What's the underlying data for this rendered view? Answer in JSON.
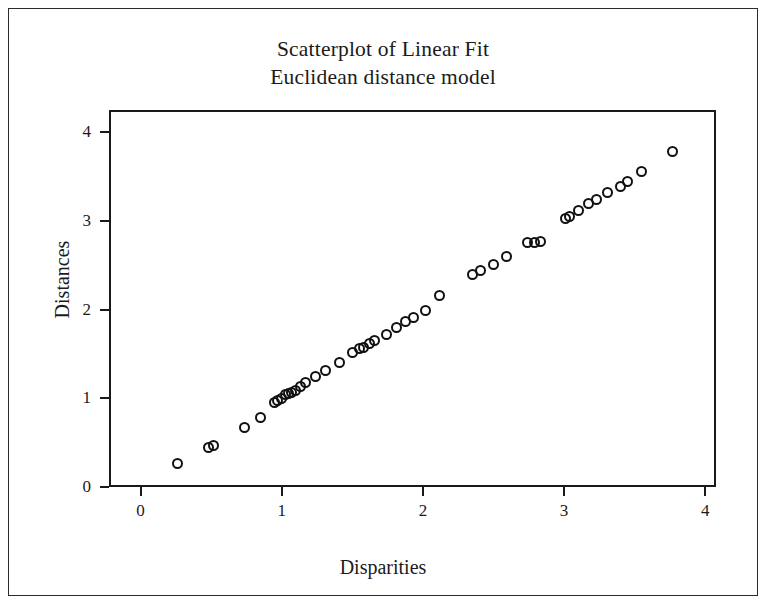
{
  "figure": {
    "title_line1": "Scatterplot of Linear Fit",
    "title_line2": "Euclidean distance model"
  },
  "chart_data": {
    "type": "scatter",
    "title": "Scatterplot of Linear Fit\nEuclidean distance model",
    "subtitle": "Euclidean distance model",
    "xlabel": "Disparities",
    "ylabel": "Distances",
    "xlim": [
      -0.22,
      4.32
    ],
    "ylim": [
      -0.33,
      4.25
    ],
    "xticks": [
      0,
      1,
      2,
      3,
      4
    ],
    "yticks": [
      0,
      1,
      2,
      3,
      4
    ],
    "xtick_labels": [
      "0",
      "1",
      "2",
      "3",
      "4"
    ],
    "ytick_labels": [
      "0",
      "1",
      "2",
      "3",
      "4"
    ],
    "grid": false,
    "legend": false,
    "marker": "open-circle",
    "marker_color": "#111111",
    "n_points": 45,
    "series": [
      {
        "name": "Euclidean distance model",
        "x": [
          0.26,
          0.48,
          0.52,
          0.74,
          0.85,
          0.95,
          0.97,
          1.0,
          1.03,
          1.05,
          1.07,
          1.1,
          1.13,
          1.17,
          1.24,
          1.31,
          1.41,
          1.5,
          1.55,
          1.58,
          1.62,
          1.66,
          1.74,
          1.81,
          1.88,
          1.93,
          2.02,
          2.12,
          2.35,
          2.41,
          2.5,
          2.59,
          2.74,
          2.79,
          2.83,
          3.01,
          3.04,
          3.1,
          3.17,
          3.23,
          3.31,
          3.4,
          3.45,
          3.55,
          3.77
        ],
        "y": [
          0.27,
          0.45,
          0.47,
          0.67,
          0.78,
          0.95,
          0.97,
          1.0,
          1.04,
          1.05,
          1.06,
          1.09,
          1.13,
          1.18,
          1.24,
          1.31,
          1.4,
          1.52,
          1.56,
          1.57,
          1.62,
          1.65,
          1.72,
          1.8,
          1.86,
          1.91,
          1.99,
          2.16,
          2.4,
          2.44,
          2.51,
          2.6,
          2.75,
          2.76,
          2.77,
          3.03,
          3.05,
          3.11,
          3.19,
          3.24,
          3.32,
          3.39,
          3.44,
          3.56,
          3.78
        ]
      }
    ]
  },
  "axes": {
    "x_title": "Disparities",
    "y_title": "Distances"
  }
}
